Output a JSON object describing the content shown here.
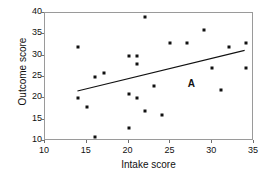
{
  "chart_data": {
    "type": "scatter",
    "title": "",
    "xlabel": "Intake score",
    "ylabel": "Outcome score",
    "xlim": [
      10,
      35
    ],
    "ylim": [
      10,
      40
    ],
    "xticks": [
      10,
      15,
      20,
      25,
      30,
      35
    ],
    "yticks": [
      10,
      15,
      20,
      25,
      30,
      35,
      40
    ],
    "grid": false,
    "legend": null,
    "marker": "square",
    "marker_color": "#111111",
    "points": [
      {
        "x": 14,
        "y": 32
      },
      {
        "x": 14,
        "y": 20
      },
      {
        "x": 15,
        "y": 18
      },
      {
        "x": 16,
        "y": 25
      },
      {
        "x": 16,
        "y": 11
      },
      {
        "x": 17,
        "y": 26
      },
      {
        "x": 20,
        "y": 30
      },
      {
        "x": 20,
        "y": 21
      },
      {
        "x": 20,
        "y": 13
      },
      {
        "x": 21,
        "y": 30
      },
      {
        "x": 21,
        "y": 28
      },
      {
        "x": 21,
        "y": 20
      },
      {
        "x": 22,
        "y": 39
      },
      {
        "x": 22,
        "y": 17
      },
      {
        "x": 23,
        "y": 23
      },
      {
        "x": 24,
        "y": 16
      },
      {
        "x": 25,
        "y": 33
      },
      {
        "x": 27,
        "y": 33
      },
      {
        "x": 29,
        "y": 36
      },
      {
        "x": 30,
        "y": 27
      },
      {
        "x": 31,
        "y": 22
      },
      {
        "x": 32,
        "y": 32
      },
      {
        "x": 34,
        "y": 33
      },
      {
        "x": 34,
        "y": 27
      }
    ],
    "trendline": {
      "label": "A",
      "x_start": 14,
      "y_start": 21.5,
      "x_end": 34,
      "y_end": 31.0,
      "label_x": 27.2,
      "label_y": 24.6
    }
  }
}
